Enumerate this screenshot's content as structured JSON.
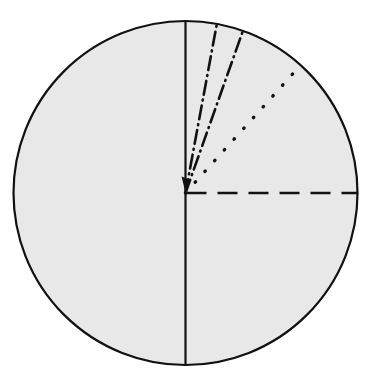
{
  "figure": {
    "name": "circle-with-angular-radii-diagram",
    "caption_fragment": "",
    "canvas": {
      "width": 368,
      "height": 381,
      "background": "#ffffff"
    },
    "circle": {
      "label": "outer-circle",
      "center_x": 185.5,
      "center_y": 193,
      "radius": 172,
      "fill": "#e8e8e8",
      "stroke": "#111111",
      "stroke_width": 2.2
    },
    "lines": [
      {
        "id": "vertical-diameter",
        "label": "Vertical diameter",
        "style": "solid",
        "angle_from_vertical_deg": 0,
        "x1": 185.5,
        "y1": 21,
        "x2": 185.5,
        "y2": 365,
        "stroke": "#111111",
        "stroke_width": 2.2,
        "dash_pattern": "none"
      },
      {
        "id": "radius-dashdot-inner",
        "label": "Dash-dot radius (inner)",
        "style": "dash-dot",
        "angle_from_vertical_deg": 10.5,
        "x1": 185.5,
        "y1": 193,
        "x2": 216.8,
        "y2": 24.2,
        "stroke": "#111111",
        "stroke_width": 2.6,
        "dash_pattern": "14 5 1 5"
      },
      {
        "id": "radius-dashdot-outer",
        "label": "Dash-dot radius (outer)",
        "style": "dash-dot",
        "angle_from_vertical_deg": 19.5,
        "x1": 185.5,
        "y1": 193,
        "x2": 242.9,
        "y2": 30.9,
        "stroke": "#111111",
        "stroke_width": 2.6,
        "dash_pattern": "14 5 1 5"
      },
      {
        "id": "radius-dotted",
        "label": "Dotted radius",
        "style": "dotted",
        "angle_from_vertical_deg": 42.0,
        "x1": 185.5,
        "y1": 193,
        "x2": 300.6,
        "y2": 65.2,
        "stroke": "#111111",
        "stroke_width": 3.4,
        "dash_pattern": "0.5 14"
      },
      {
        "id": "radius-dashed-horizontal",
        "label": "Dashed horizontal radius",
        "style": "dashed",
        "angle_from_vertical_deg": 90.0,
        "x1": 186.5,
        "y1": 193,
        "x2": 357.5,
        "y2": 193,
        "stroke": "#111111",
        "stroke_width": 2.4,
        "dash_pattern": "20 11"
      }
    ]
  },
  "chart_data": {
    "type": "scatter",
    "title": "",
    "subtitle": "",
    "xlabel": "",
    "ylabel": "",
    "grid": false,
    "legend_position": "none",
    "units": "degrees from vertical (clockwise)",
    "categories": [
      "vertical diameter (solid)",
      "dash-dot radius (inner)",
      "dash-dot radius (outer)",
      "dotted radius",
      "dashed radius (horizontal)"
    ],
    "values": [
      0,
      10.5,
      19.5,
      42.0,
      90.0
    ],
    "series": [
      {
        "name": "angle from vertical (deg)",
        "values": [
          0,
          10.5,
          19.5,
          42.0,
          90.0
        ]
      },
      {
        "name": "line style",
        "values": [
          "solid",
          "dash-dot",
          "dash-dot",
          "dotted",
          "dashed"
        ]
      }
    ],
    "xlim": [
      0,
      90
    ],
    "ylim": [
      0,
      1
    ]
  }
}
